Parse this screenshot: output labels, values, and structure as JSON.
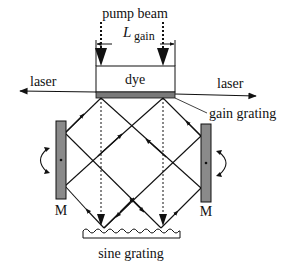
{
  "labels": {
    "pump_beam": "pump beam",
    "L": "L",
    "gain_sub": "gain",
    "dye": "dye",
    "laser_left": "laser",
    "laser_right": "laser",
    "gain_grating": "gain grating",
    "mirror_left": "M",
    "mirror_right": "M",
    "sine_grating": "sine grating"
  },
  "colors": {
    "line": "#111111",
    "mirror_fill": "#8a8a8a",
    "gain_grating_fill": "#7a7a7a"
  }
}
